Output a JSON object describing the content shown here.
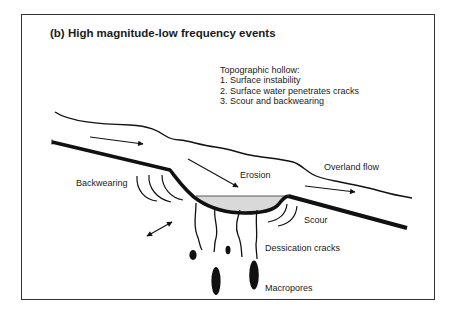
{
  "figure": {
    "title": "(b) High magnitude-low frequency events",
    "note": {
      "heading": "Topographic hollow:",
      "items": [
        "1.  Surface instability",
        "2.  Surface water penetrates cracks",
        "3.  Scour and backwearing"
      ]
    },
    "labels": {
      "erosion": "Erosion",
      "overland_flow": "Overland flow",
      "backwearing": "Backwearing",
      "scour": "Scour",
      "dessication_cracks": "Dessication cracks",
      "macropores": "Macropores"
    },
    "colors": {
      "ink": "#111111",
      "hollow_fill": "#d9d9d9",
      "frame": "#333333"
    }
  }
}
